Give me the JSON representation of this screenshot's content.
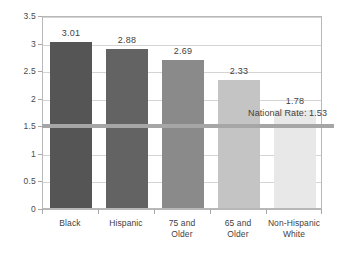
{
  "chart_data": {
    "type": "bar",
    "title": "",
    "subtitle": "",
    "xlabel": "",
    "ylabel": "",
    "ylim": [
      0,
      3.5
    ],
    "ytick_labels": [
      "0",
      "0.5",
      "1",
      "1.5",
      "2",
      "2.5",
      "3",
      "3.5"
    ],
    "ytick_values": [
      0,
      0.5,
      1,
      1.5,
      2,
      2.5,
      3,
      3.5
    ],
    "grid": true,
    "legend": "none",
    "categories": [
      "Black",
      "Hispanic",
      "75 and Older",
      "65 and Older",
      "Non-Hispanic White"
    ],
    "category_lines": [
      [
        "Black"
      ],
      [
        "Hispanic"
      ],
      [
        "75 and",
        "Older"
      ],
      [
        "65 and",
        "Older"
      ],
      [
        "Non-Hispanic",
        "White"
      ]
    ],
    "values": [
      3.01,
      2.88,
      2.69,
      2.33,
      1.78
    ],
    "value_labels": [
      "3.01",
      "2.88",
      "2.69",
      "2.33",
      "1.78"
    ],
    "bar_colors": [
      "#555555",
      "#636363",
      "#8a8a8a",
      "#c4c4c4",
      "#e8e8e8"
    ],
    "annotations": [
      {
        "name": "national-rate",
        "label": "National Rate: 1.53",
        "value": 1.53,
        "color": "#a6a6a6",
        "style": "horizontal-reference-line"
      }
    ]
  },
  "colors": {
    "background": "#ffffff",
    "frame": "#b8b8b8",
    "gridline": "#d4d4d4",
    "text": "#3f3f3f",
    "reference_line": "#a6a6a6"
  }
}
